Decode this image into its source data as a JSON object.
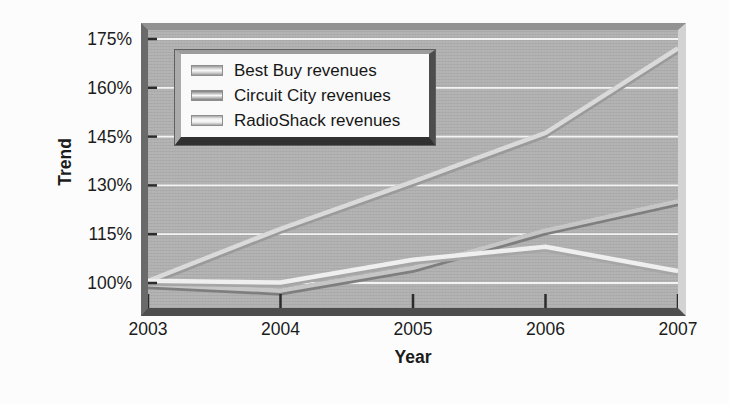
{
  "chart_data": {
    "type": "line",
    "title": "",
    "xlabel": "Year",
    "ylabel": "Trend",
    "x": [
      2003,
      2004,
      2005,
      2006,
      2007
    ],
    "x_tick_labels": [
      "2003",
      "2004",
      "2005",
      "2006",
      "2007"
    ],
    "y_tick_labels": [
      "100%",
      "115%",
      "130%",
      "145%",
      "160%",
      "175%"
    ],
    "y_tick_values": [
      100,
      115,
      130,
      145,
      160,
      175
    ],
    "ylim": [
      92,
      178
    ],
    "grid": "horizontal white gridlines on gray panel",
    "legend_position": "upper-left",
    "series": [
      {
        "name": "Best Buy revenues",
        "values": [
          100.5,
          116.5,
          131,
          146,
          172
        ],
        "color": "#dadada",
        "edge_color": "#9a9a9a"
      },
      {
        "name": "Circuit City revenues",
        "values": [
          99.5,
          97.5,
          104.5,
          116,
          125
        ],
        "color": "#c6c6c6",
        "edge_color": "#7e7e7e"
      },
      {
        "name": "RadioShack revenues",
        "values": [
          100.5,
          100,
          107,
          111,
          103.5
        ],
        "color": "#efefef",
        "edge_color": "#a6a6a6"
      }
    ],
    "colors": {
      "panel_bg": "#b1b1b1",
      "grid_line": "#f3f3f3",
      "tick_mark": "#2b2b2b",
      "text": "#1b1b1b",
      "page_bg": "#fcfcfc",
      "legend_bg": "#fafafa"
    }
  }
}
